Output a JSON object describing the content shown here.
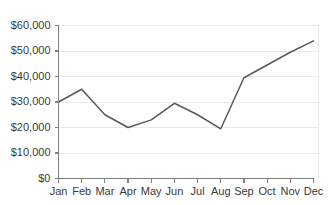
{
  "chart_data": {
    "type": "line",
    "title": "",
    "subtitle": "",
    "xlabel": "",
    "ylabel": "",
    "categories": [
      "Jan",
      "Feb",
      "Mar",
      "Apr",
      "May",
      "Jun",
      "Jul",
      "Aug",
      "Sep",
      "Oct",
      "Nov",
      "Dec"
    ],
    "values": [
      30000,
      35000,
      25000,
      20000,
      23000,
      29500,
      25000,
      19500,
      39500,
      44500,
      49500,
      54000
    ],
    "series": [
      {
        "name": "",
        "values": [
          30000,
          35000,
          25000,
          20000,
          23000,
          29500,
          25000,
          19500,
          39500,
          44500,
          49500,
          54000
        ]
      }
    ],
    "ylim": [
      0,
      60000
    ],
    "ytick_values": [
      0,
      10000,
      20000,
      30000,
      40000,
      50000,
      60000
    ],
    "ytick_labels": [
      "$0",
      "$10,000",
      "$20,000",
      "$30,000",
      "$40,000",
      "$50,000",
      "$60,000"
    ],
    "xtick_labels": [
      "Jan",
      "Feb",
      "Mar",
      "Apr",
      "May",
      "Jun",
      "Jul",
      "Aug",
      "Sep",
      "Oct",
      "Nov",
      "Dec"
    ],
    "grid": true,
    "grid_axis": "y",
    "legend": false,
    "legend_position": "none",
    "annotations": []
  },
  "style": {
    "line_color": "#595959",
    "grid_color": "#e8e8e8",
    "axis_color": "#808080",
    "text_color": "#3a3a3a",
    "background": "#ffffff"
  }
}
